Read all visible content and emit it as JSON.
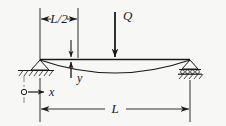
{
  "figure": {
    "background_color": "#f7f7f5",
    "line_color": "#1a1a1a"
  },
  "labels": {
    "half_span": "L/2",
    "load": "Q",
    "deflection_axis": "y",
    "longitudinal_axis": "x",
    "full_span": "L"
  },
  "geometry": {
    "beam_left_x": 40,
    "beam_right_x": 190,
    "beam_y": 60,
    "midspan_x": 115,
    "max_deflection_px": 13
  },
  "elements": {
    "left_support": "pinned-support",
    "right_support": "roller-support",
    "load_direction": "downward",
    "origin_marker": "open-circle",
    "deflection_curve": "sagging-parabola"
  }
}
